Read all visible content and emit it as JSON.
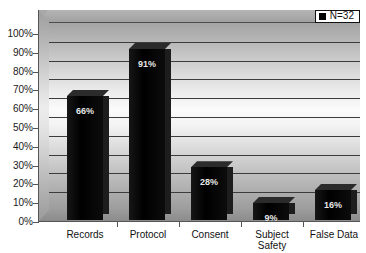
{
  "chart_data": {
    "type": "bar",
    "title": "",
    "subtitle": "",
    "xlabel": "",
    "ylabel": "",
    "categories": [
      "Records",
      "Protocol",
      "Consent",
      "Subject\nSafety",
      "False Data"
    ],
    "values": [
      66,
      91,
      28,
      9,
      16
    ],
    "value_labels": [
      "66%",
      "91%",
      "28%",
      "9%",
      "16%"
    ],
    "series": [
      {
        "name": "N=32",
        "values": [
          66,
          91,
          28,
          9,
          16
        ]
      }
    ],
    "ylim": [
      0,
      100
    ],
    "ytick_step": 10,
    "ytick_labels": [
      "100%",
      "90%",
      "80%",
      "70%",
      "60%",
      "50%",
      "40%",
      "30%",
      "20%",
      "10%",
      "0%"
    ],
    "grid": true,
    "grid_axis": "y",
    "legend": {
      "position": "top-right",
      "entries": [
        "N=32"
      ]
    },
    "style": "3d-column",
    "colors": {
      "bar": "#000000",
      "bar_top": "#2b2b2b",
      "bar_side": "#1d1d1d",
      "plot_bg_top": "#a4a4a4",
      "plot_bg_mid": "#fbfbfb",
      "plot_bg_bottom": "#9b9b9b",
      "gridline": "#3c3c3c",
      "axis": "#555555",
      "text": "#111111",
      "value_text": "#e8e8e8",
      "legend_bg": "#ffffff",
      "legend_border": "#111111"
    }
  },
  "legend": {
    "label": "N=32"
  }
}
